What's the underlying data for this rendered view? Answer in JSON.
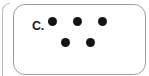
{
  "panel": {
    "label": "C.",
    "border_color": "#9e9e9e",
    "background_color": "#ffffff",
    "corner_radius_px": 12
  },
  "neighbor_panel": {
    "visible": true,
    "border_color": "#b9b9b9"
  },
  "dots": {
    "color": "#141414",
    "total_count": 5,
    "diameter_px": 9,
    "arrangement": "3 over 2",
    "rows": [
      {
        "name": "top-row",
        "count": 3,
        "y": 21
      },
      {
        "name": "bottom-row",
        "count": 2,
        "y": 42
      }
    ],
    "items": [
      {
        "id": "dot-1",
        "row": "top-row",
        "x": 52,
        "y": 21
      },
      {
        "id": "dot-2",
        "row": "top-row",
        "x": 77,
        "y": 21
      },
      {
        "id": "dot-3",
        "row": "top-row",
        "x": 102,
        "y": 21
      },
      {
        "id": "dot-4",
        "row": "bottom-row",
        "x": 65,
        "y": 42
      },
      {
        "id": "dot-5",
        "row": "bottom-row",
        "x": 90,
        "y": 42
      }
    ]
  }
}
